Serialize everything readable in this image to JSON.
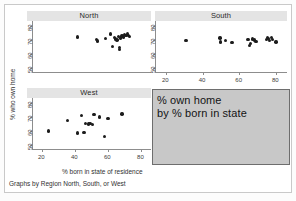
{
  "figure": {
    "ylabel": "% who own home",
    "xlabel": "% born in state of residence",
    "caption": "Graphs by Region North, South, or West",
    "yticks": [
      "80",
      "70",
      "60",
      "50"
    ],
    "xticks": [
      "20",
      "40",
      "60",
      "80"
    ],
    "marker_color": "#1c1c1c",
    "title_strip_color": "#e4e4e4",
    "annotation_box_color": "#c8c8c8",
    "annotation_box_border": "#6e6e6e"
  },
  "annotation": {
    "line1": "% own home",
    "line2": "by % born in state"
  },
  "chart_data": {
    "type": "scatter",
    "title": "",
    "xlabel": "% born in state of residence",
    "ylabel": "% who own home",
    "xlim": [
      14,
      86
    ],
    "ylim": [
      46,
      84
    ],
    "xticks": [
      20,
      40,
      60,
      80
    ],
    "yticks": [
      50,
      60,
      70,
      80
    ],
    "grid": false,
    "legend": null,
    "panels": [
      {
        "name": "North",
        "label": "North",
        "points": [
          {
            "x": 41.5,
            "y": 72.3
          },
          {
            "x": 53.0,
            "y": 70.6
          },
          {
            "x": 53.6,
            "y": 69.5
          },
          {
            "x": 58.5,
            "y": 71.0
          },
          {
            "x": 61.5,
            "y": 74.4
          },
          {
            "x": 62.8,
            "y": 65.3
          },
          {
            "x": 64.0,
            "y": 71.8
          },
          {
            "x": 64.6,
            "y": 70.8
          },
          {
            "x": 65.4,
            "y": 70.0
          },
          {
            "x": 66.3,
            "y": 72.6
          },
          {
            "x": 66.8,
            "y": 64.6
          },
          {
            "x": 67.0,
            "y": 63.2
          },
          {
            "x": 67.6,
            "y": 71.5
          },
          {
            "x": 68.4,
            "y": 73.0
          },
          {
            "x": 69.2,
            "y": 72.2
          },
          {
            "x": 70.0,
            "y": 74.0
          },
          {
            "x": 70.8,
            "y": 73.2
          },
          {
            "x": 71.6,
            "y": 74.6
          },
          {
            "x": 72.4,
            "y": 73.6
          },
          {
            "x": 73.0,
            "y": 72.8
          }
        ]
      },
      {
        "name": "South",
        "label": "South",
        "points": [
          {
            "x": 31.0,
            "y": 69.6
          },
          {
            "x": 49.5,
            "y": 71.6
          },
          {
            "x": 49.8,
            "y": 68.6
          },
          {
            "x": 52.5,
            "y": 69.8
          },
          {
            "x": 56.0,
            "y": 68.4
          },
          {
            "x": 64.8,
            "y": 70.4
          },
          {
            "x": 65.6,
            "y": 66.2
          },
          {
            "x": 66.0,
            "y": 67.6
          },
          {
            "x": 67.2,
            "y": 70.8
          },
          {
            "x": 68.4,
            "y": 70.0
          },
          {
            "x": 69.0,
            "y": 69.2
          },
          {
            "x": 74.8,
            "y": 70.4
          },
          {
            "x": 75.4,
            "y": 72.0
          },
          {
            "x": 76.0,
            "y": 71.2
          },
          {
            "x": 76.6,
            "y": 69.8
          },
          {
            "x": 77.4,
            "y": 71.8
          },
          {
            "x": 78.0,
            "y": 70.6
          },
          {
            "x": 80.0,
            "y": 68.8
          }
        ]
      },
      {
        "name": "West",
        "label": "West",
        "points": [
          {
            "x": 24.0,
            "y": 59.8
          },
          {
            "x": 35.5,
            "y": 67.6
          },
          {
            "x": 41.5,
            "y": 58.4
          },
          {
            "x": 44.0,
            "y": 71.4
          },
          {
            "x": 45.5,
            "y": 58.6
          },
          {
            "x": 46.5,
            "y": 65.4
          },
          {
            "x": 48.0,
            "y": 65.0
          },
          {
            "x": 49.0,
            "y": 65.2
          },
          {
            "x": 50.5,
            "y": 64.8
          },
          {
            "x": 51.5,
            "y": 72.0
          },
          {
            "x": 55.0,
            "y": 70.0
          },
          {
            "x": 58.0,
            "y": 56.0
          },
          {
            "x": 60.0,
            "y": 69.2
          },
          {
            "x": 68.5,
            "y": 72.4
          }
        ]
      }
    ]
  }
}
